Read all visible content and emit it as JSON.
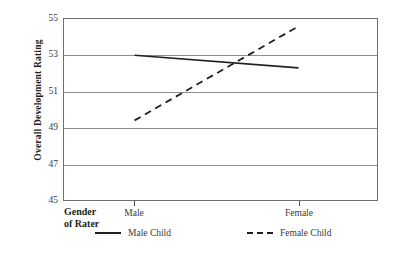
{
  "chart_data": {
    "type": "line",
    "title": "",
    "xlabel": "Gender of Rater",
    "ylabel": "Overall Development Rating",
    "categories": [
      "Male",
      "Female"
    ],
    "ylim": [
      45,
      55
    ],
    "yticks": [
      45,
      47,
      49,
      51,
      53,
      55
    ],
    "grid": true,
    "legend_position": "bottom",
    "series": [
      {
        "name": "Male Child",
        "style": "solid",
        "values": [
          53.0,
          52.3
        ]
      },
      {
        "name": "Female Child",
        "style": "dashed",
        "values": [
          49.4,
          54.6
        ]
      }
    ]
  },
  "axis": {
    "y_title": "Overall Development Rating",
    "y_tick_labels": [
      "55",
      "53",
      "51",
      "49",
      "47",
      "45"
    ],
    "x_title_line1": "Gender",
    "x_title_line2": "of Rater",
    "x_tick_labels": [
      "Male",
      "Female"
    ]
  },
  "legend": {
    "entries": [
      {
        "label": "Male Child",
        "style": "solid"
      },
      {
        "label": "Female Child",
        "style": "dashed"
      }
    ]
  },
  "colors": {
    "line": "#231f20",
    "grid": "#8d8d8d",
    "border": "#6f6f6f",
    "text": "#231f20",
    "tick_text": "#3a3a3a"
  }
}
